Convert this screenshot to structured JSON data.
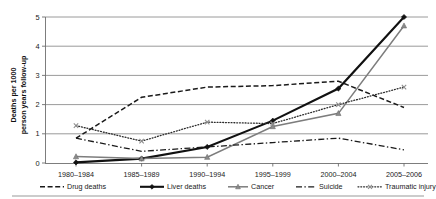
{
  "chart_data": {
    "type": "line",
    "title": "",
    "xlabel": "",
    "ylabel": "Deaths per 1000 person years follow-up",
    "ylabel_line1": "Deaths per 1000",
    "ylabel_line2": "person years follow-up",
    "categories": [
      "1980–1984",
      "1985–1989",
      "1990–1994",
      "1995–1999",
      "2000–2004",
      "2005–2006"
    ],
    "ylim": [
      0,
      5
    ],
    "yticks": [
      "0",
      "1",
      "2",
      "3",
      "4",
      "5"
    ],
    "ytick_values": [
      0,
      1,
      2,
      3,
      4,
      5
    ],
    "grid": true,
    "legend_position": "bottom",
    "series": [
      {
        "name": "Drug deaths",
        "values": [
          0.85,
          2.25,
          2.6,
          2.65,
          2.8,
          1.9
        ],
        "style": "dashed",
        "color": "#1a1a1a"
      },
      {
        "name": "Liver deaths",
        "values": [
          0.02,
          0.15,
          0.55,
          1.45,
          2.55,
          5.0
        ],
        "style": "solid-thick",
        "color": "#111111"
      },
      {
        "name": "Cancer",
        "values": [
          0.22,
          0.15,
          0.2,
          1.25,
          1.7,
          4.7
        ],
        "style": "solid-gray",
        "color": "#7d7d7d"
      },
      {
        "name": "Suicide",
        "values": [
          0.85,
          0.4,
          0.55,
          0.7,
          0.85,
          0.45
        ],
        "style": "dash-dot",
        "color": "#1a1a1a"
      },
      {
        "name": "Traumatic injury",
        "values": [
          1.28,
          0.75,
          1.4,
          1.35,
          2.0,
          2.6
        ],
        "style": "dotted",
        "color": "#2b2b2b"
      }
    ]
  },
  "legend": {
    "items": [
      {
        "label": "Drug deaths"
      },
      {
        "label": "Liver deaths"
      },
      {
        "label": "Cancer"
      },
      {
        "label": "Suicide"
      },
      {
        "label": "Traumatic injury"
      }
    ]
  }
}
